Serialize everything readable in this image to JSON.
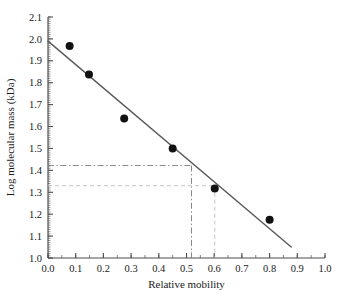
{
  "chart_data": {
    "type": "scatter",
    "title": "",
    "xlabel": "Relative mobility",
    "ylabel": "Log molecular mass (kDa)",
    "xlim": [
      0.0,
      1.0
    ],
    "ylim": [
      1.0,
      2.1
    ],
    "grid": false,
    "legend": null,
    "x_ticks": [
      "0.0",
      "0.1",
      "0.2",
      "0.3",
      "0.4",
      "0.5",
      "0.6",
      "0.7",
      "0.8",
      "0.9",
      "1.0"
    ],
    "x_tick_values": [
      0.0,
      0.1,
      0.2,
      0.3,
      0.4,
      0.5,
      0.6,
      0.7,
      0.8,
      0.9,
      1.0
    ],
    "y_ticks": [
      "1.0",
      "1.1",
      "1.2",
      "1.3",
      "1.4",
      "1.5",
      "1.6",
      "1.7",
      "1.8",
      "1.9",
      "2.0",
      "2.1"
    ],
    "y_tick_values": [
      1.0,
      1.1,
      1.2,
      1.3,
      1.4,
      1.5,
      1.6,
      1.7,
      1.8,
      1.9,
      2.0,
      2.1
    ],
    "x_minor_step": 0.05,
    "y_minor_step": 0.01,
    "series": [
      {
        "name": "standards",
        "type": "scatter",
        "marker": "filled-circle",
        "color": "#111111",
        "points": [
          {
            "x": 0.078,
            "y": 1.968
          },
          {
            "x": 0.148,
            "y": 1.838
          },
          {
            "x": 0.275,
            "y": 1.637
          },
          {
            "x": 0.45,
            "y": 1.5
          },
          {
            "x": 0.602,
            "y": 1.317
          },
          {
            "x": 0.8,
            "y": 1.175
          }
        ]
      },
      {
        "name": "regression line",
        "type": "line",
        "color": "#5a5a5a",
        "x_start": 0.0,
        "y_start": 1.99,
        "x_end": 0.878,
        "y_end": 1.05
      }
    ],
    "annotations": [
      {
        "name": "upper-guide",
        "style": "dash-dot",
        "color": "#7a7a7a",
        "y": 1.422,
        "x": 0.518,
        "x_from": 0.0,
        "y_to": 1.0
      },
      {
        "name": "lower-guide",
        "style": "dashed",
        "color": "#bdbdbd",
        "y": 1.33,
        "x": 0.602,
        "x_from": 0.0,
        "y_to": 1.0
      }
    ]
  },
  "axes": {
    "x_title": "Relative mobility",
    "y_title": "Log molecular mass (kDa)"
  },
  "colors": {
    "axis": "#4d4d4d",
    "marker": "#111111",
    "fit_line": "#5a5a5a",
    "guide_upper": "#7a7a7a",
    "guide_lower": "#bdbdbd",
    "text": "#1a1a1a",
    "background": "#ffffff"
  }
}
